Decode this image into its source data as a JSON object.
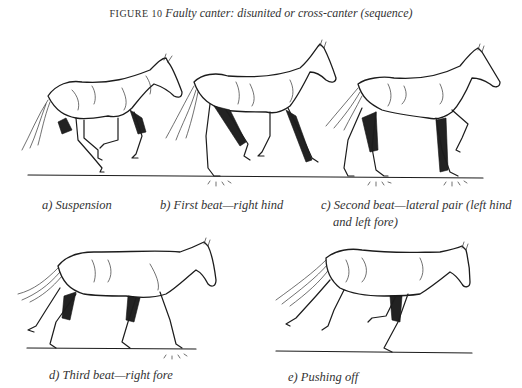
{
  "figure": {
    "label": "FIGURE 10",
    "title": "Faulty canter: disunited or cross-canter (sequence)"
  },
  "panels": [
    {
      "id": "a",
      "caption": "a) Suspension"
    },
    {
      "id": "b",
      "caption": "b) First beat—right hind"
    },
    {
      "id": "c",
      "caption_line1": "c) Second beat—lateral pair (left hind",
      "caption_line2": "and left fore)"
    },
    {
      "id": "d",
      "caption": "d) Third beat—right fore"
    },
    {
      "id": "e",
      "caption": "e) Pushing off"
    }
  ],
  "colors": {
    "ink": "#1c1c1c",
    "background": "#ffffff"
  }
}
